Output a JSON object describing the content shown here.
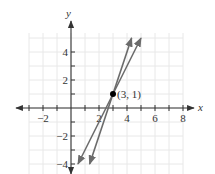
{
  "chart_data": {
    "type": "line",
    "title": "",
    "xlabel": "x",
    "ylabel": "y",
    "xlim": [
      -3,
      8
    ],
    "ylim": [
      -4.5,
      5
    ],
    "grid": true,
    "x_ticks": [
      -3,
      -2,
      -1,
      1,
      2,
      3,
      4,
      5,
      6,
      7,
      8
    ],
    "x_tick_labels": [
      {
        "value": -2,
        "label": "−2"
      },
      {
        "value": 2,
        "label": "2"
      },
      {
        "value": 4,
        "label": "4"
      },
      {
        "value": 6,
        "label": "6"
      },
      {
        "value": 8,
        "label": "8"
      }
    ],
    "y_ticks": [
      -4,
      -3,
      -2,
      -1,
      1,
      2,
      3,
      4
    ],
    "y_tick_labels": [
      {
        "value": 4,
        "label": "4"
      },
      {
        "value": 2,
        "label": "2"
      },
      {
        "value": -2,
        "label": "−2"
      },
      {
        "value": -4,
        "label": "−4"
      }
    ],
    "series": [
      {
        "name": "line 1",
        "equation": "y = 3x − 8",
        "slope": 3,
        "points": [
          [
            1.33,
            -4
          ],
          [
            4.33,
            5
          ]
        ],
        "arrows": "both"
      },
      {
        "name": "line 2",
        "equation": "y = 2x − 5",
        "slope": 2,
        "points": [
          [
            0.5,
            -4
          ],
          [
            5,
            5
          ]
        ],
        "arrows": "both"
      }
    ],
    "annotations": [
      {
        "point": [
          3,
          1
        ],
        "label": "(3, 1)",
        "marker": "filled-circle"
      }
    ]
  },
  "colors": {
    "line": "#6b6b6b",
    "axis": "#333333",
    "grid": "#e8e8e8",
    "point": "#000000"
  }
}
